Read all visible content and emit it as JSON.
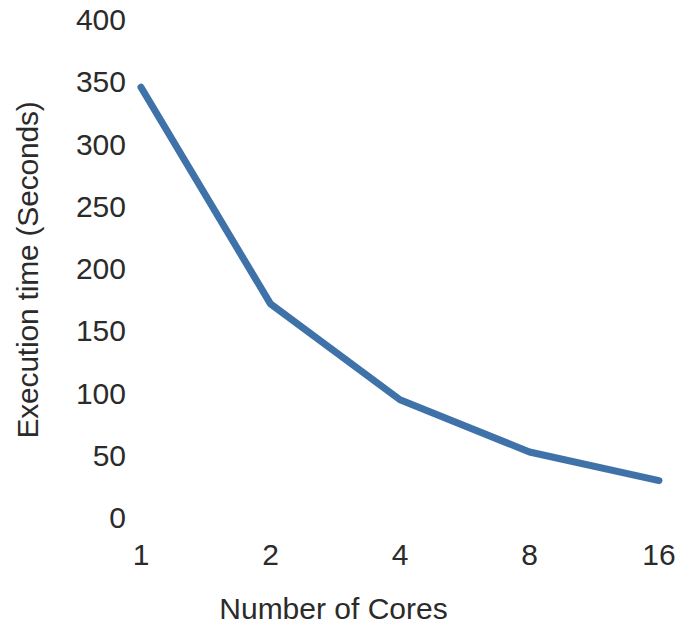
{
  "chart_data": {
    "type": "line",
    "title": "",
    "xlabel": "Number of Cores",
    "ylabel": "Execution time (Seconds)",
    "categories": [
      "1",
      "2",
      "4",
      "8",
      "16"
    ],
    "x": [
      1,
      2,
      4,
      8,
      16
    ],
    "values": [
      346,
      172,
      95,
      53,
      30
    ],
    "series": [
      {
        "name": "Execution time",
        "values": [
          346,
          172,
          95,
          53,
          30
        ]
      }
    ],
    "ylim": [
      0,
      400
    ],
    "y_ticks": [
      0,
      50,
      100,
      150,
      200,
      250,
      300,
      350,
      400
    ],
    "y_tick_labels": [
      "0",
      "50",
      "100",
      "150",
      "200",
      "250",
      "300",
      "350",
      "400"
    ],
    "x_tick_labels": [
      "1",
      "2",
      "4",
      "8",
      "16"
    ],
    "grid": false,
    "legend": false,
    "legend_position": "none",
    "line_color": "#3f72a9",
    "line_width": 7,
    "markers": false,
    "x_scale": "categorical"
  },
  "axes": {
    "y_title": "Execution time (Seconds)",
    "x_title": "Number of Cores"
  },
  "colors": {
    "line": "#3f72a9",
    "text": "#2b2b2b",
    "background": "#ffffff"
  }
}
